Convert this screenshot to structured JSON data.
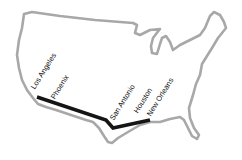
{
  "map": {
    "outline_color": "#a8a8a8",
    "route_color": "#151515",
    "route": {
      "stops": [
        {
          "name": "Los Angeles",
          "x": 37,
          "y": 97
        },
        {
          "name": "Phoenix",
          "x": 57,
          "y": 104
        },
        {
          "name": "San Antonio",
          "x": 107,
          "y": 122
        },
        {
          "name": "Houston",
          "x": 130,
          "y": 124
        },
        {
          "name": "New Orleans",
          "x": 150,
          "y": 120
        }
      ]
    },
    "labels": [
      {
        "text": "Los Angeles",
        "x": 36,
        "y": 90
      },
      {
        "text": "Phoenix",
        "x": 56,
        "y": 100
      },
      {
        "text": "San Antonio",
        "x": 116,
        "y": 121
      },
      {
        "text": "Houston",
        "x": 139,
        "y": 114
      },
      {
        "text": "New Orleans",
        "x": 152,
        "y": 117
      }
    ]
  }
}
